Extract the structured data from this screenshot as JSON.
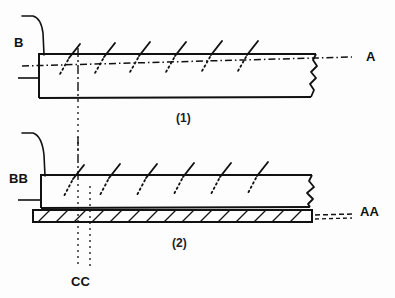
{
  "diagram": {
    "title_visible": false,
    "background_color": "#fdfdfd",
    "line_color": "#111111",
    "figures": [
      {
        "id": "figure-1",
        "caption": "(1)",
        "caption_x": 182,
        "caption_y": 118,
        "left_label": "B",
        "left_label_x": 14,
        "left_label_y": 40,
        "right_label": "A",
        "right_label_x": 367,
        "right_label_y": 51,
        "body": {
          "x": 38,
          "y": 54,
          "width": 278,
          "height": 44
        },
        "tick_count": 6,
        "tick_x_positions": [
          75,
          110,
          145,
          181,
          217,
          253
        ]
      },
      {
        "id": "figure-2",
        "caption": "(2)",
        "caption_x": 176,
        "caption_y": 243,
        "left_label": "BB",
        "left_label_x": 10,
        "left_label_y": 175,
        "right_label": "AA",
        "right_label_x": 365,
        "right_label_y": 206,
        "body": {
          "x": 40,
          "y": 175,
          "width": 272,
          "height": 32
        },
        "hatch_band": {
          "x": 33,
          "y": 210,
          "width": 279,
          "height": 12
        },
        "tick_count": 6,
        "tick_x_positions": [
          79,
          115,
          152,
          189,
          226,
          263
        ]
      }
    ],
    "section_line": {
      "label": "CC",
      "label_x": 72,
      "label_y": 282,
      "x_left": 78,
      "x_right": 90
    },
    "labels": {
      "b": "B",
      "a": "A",
      "bb": "BB",
      "aa": "AA",
      "cc": "CC",
      "fig1": "(1)",
      "fig2": "(2)"
    }
  }
}
